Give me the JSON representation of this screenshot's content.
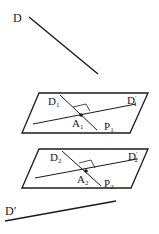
{
  "diagram": {
    "type": "geometry-projection",
    "colors": {
      "stroke": "#1a1a1a",
      "background": "#ffffff"
    },
    "line_D": {
      "label": "D",
      "x1": 29,
      "y1": 17,
      "x2": 98,
      "y2": 74,
      "label_x": 13,
      "label_y": 22
    },
    "plane_1": {
      "label": "P",
      "sub": "1",
      "points": "39,93 148,93 130,133 22,133",
      "label_x": 104,
      "label_y": 130,
      "D_line": {
        "label": "D",
        "sub": "1",
        "x1": 60,
        "y1": 95,
        "x2": 97,
        "y2": 130,
        "label_x": 48,
        "label_y": 105
      },
      "Dprime_line": {
        "label": "D",
        "sub": "1",
        "prime": "′",
        "x1": 33,
        "y1": 124,
        "x2": 136,
        "y2": 104,
        "label_x": 127,
        "label_y": 104
      },
      "point": {
        "label": "A",
        "sub": "1",
        "cx": 81,
        "cy": 115,
        "label_x": 72,
        "label_y": 127
      },
      "right_angle": "73,107 86,104 90,111"
    },
    "plane_2": {
      "label": "P",
      "sub": "2",
      "points": "39,149 148,149 131,188 22,188",
      "label_x": 104,
      "label_y": 187,
      "D_line": {
        "label": "D",
        "sub": "2",
        "x1": 62,
        "y1": 151,
        "x2": 101,
        "y2": 186,
        "label_x": 50,
        "label_y": 161
      },
      "Dprime_line": {
        "label": "D",
        "sub": "2",
        "prime": "′",
        "x1": 35,
        "y1": 178,
        "x2": 137,
        "y2": 159,
        "label_x": 128,
        "label_y": 160
      },
      "point": {
        "label": "A",
        "sub": "2",
        "cx": 86,
        "cy": 171,
        "label_x": 77,
        "label_y": 183
      },
      "right_angle": "79,163 91,160 95,168"
    },
    "line_Dprime": {
      "label": "D′",
      "x1": 5,
      "y1": 221,
      "x2": 116,
      "y2": 201,
      "label_x": 5,
      "label_y": 215
    }
  }
}
